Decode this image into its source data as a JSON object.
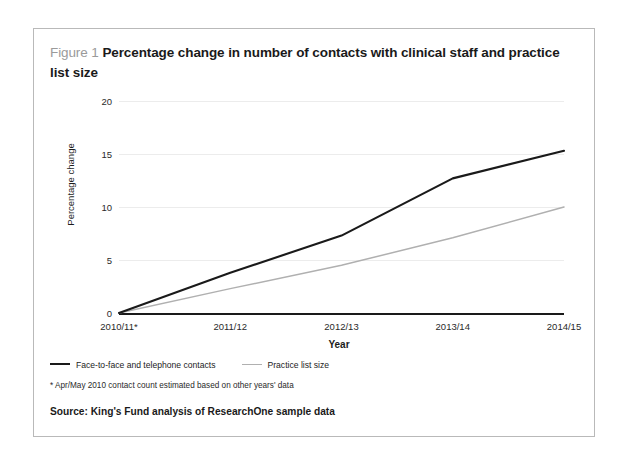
{
  "figure": {
    "label": "Figure 1",
    "title": "Percentage change in number of contacts with clinical staff and practice list size",
    "footnote": "* Apr/May 2010 contact count estimated based on other years' data",
    "source": "Source: King's Fund analysis of ResearchOne sample data",
    "border_color": "#b9b9b9"
  },
  "chart_data": {
    "type": "line",
    "title": "Percentage change in number of contacts with clinical staff and practice list size",
    "xlabel": "Year",
    "ylabel": "Percentage change",
    "categories": [
      "2010/11*",
      "2011/12",
      "2012/13",
      "2013/14",
      "2014/15"
    ],
    "series": [
      {
        "name": "Face-to-face and telephone contacts",
        "color": "#1a1a1a",
        "values": [
          0,
          3.8,
          7.3,
          12.7,
          15.3
        ]
      },
      {
        "name": "Practice list size",
        "color": "#b0b0b0",
        "values": [
          0,
          2.3,
          4.5,
          7.1,
          10.0
        ]
      }
    ],
    "ylim": [
      0,
      20
    ],
    "yticks": [
      0,
      5,
      10,
      15,
      20
    ],
    "ytick_labels": [
      "0",
      "5",
      "10",
      "15",
      "20"
    ],
    "grid": true,
    "legend_position": "below-left"
  }
}
